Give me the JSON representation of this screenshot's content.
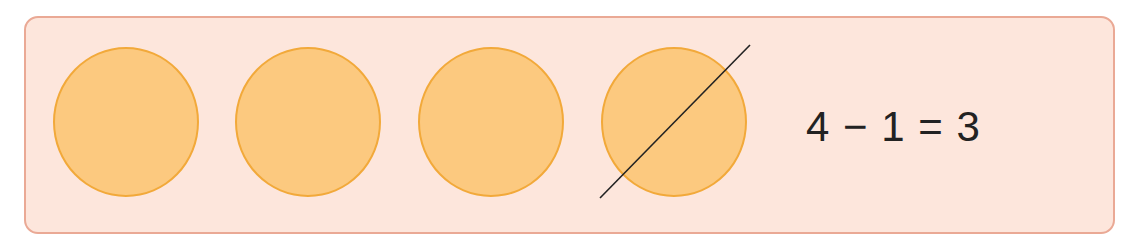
{
  "diagram": {
    "type": "subtraction-counters",
    "counters": [
      {
        "index": 1,
        "crossed_out": false
      },
      {
        "index": 2,
        "crossed_out": false
      },
      {
        "index": 3,
        "crossed_out": false
      },
      {
        "index": 4,
        "crossed_out": true
      }
    ],
    "equation": "4 − 1 = 3",
    "colors": {
      "panel_fill": "#fde6dc",
      "panel_border": "#eaa995",
      "counter_fill": "#fcc97f",
      "counter_border": "#f2a93a",
      "slash": "#222222",
      "text": "#222222"
    }
  }
}
